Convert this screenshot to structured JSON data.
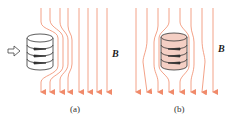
{
  "figure": {
    "panels": [
      {
        "label": "(a)",
        "field_label": "B",
        "description": "field lines bend around coil; arrow pushing coil into field"
      },
      {
        "label": "(b)",
        "field_label": "B",
        "description": "field lines bend around tinted coil inside field"
      }
    ],
    "colors": {
      "field_line": "#f08a6a",
      "coil_fill_b": "#f4cfc4",
      "coil_stroke": "#333333"
    }
  }
}
